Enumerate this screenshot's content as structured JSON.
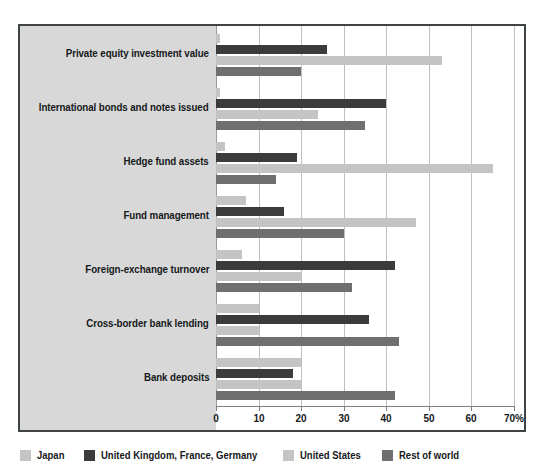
{
  "chart_data": {
    "type": "bar",
    "orientation": "horizontal",
    "title": "",
    "subtitle": "",
    "xlabel": "",
    "ylabel": "",
    "xlim": [
      0,
      70
    ],
    "xticks": [
      0,
      10,
      20,
      30,
      40,
      50,
      60,
      70
    ],
    "xtick_labels": [
      "0",
      "10",
      "20",
      "30",
      "40",
      "50",
      "60",
      "70%"
    ],
    "grid": true,
    "legend_position": "bottom",
    "categories": [
      "Private equity investment value",
      "International bonds and notes issued",
      "Hedge fund assets",
      "Fund management",
      "Foreign-exchange turnover",
      "Cross-border bank lending",
      "Bank deposits"
    ],
    "series": [
      {
        "name": "Japan",
        "color": "#c4c4c4",
        "values": [
          1,
          1,
          2,
          7,
          6,
          10,
          20
        ]
      },
      {
        "name": "United Kingdom, France, Germany",
        "color": "#3b3b3b",
        "values": [
          26,
          40,
          19,
          16,
          42,
          36,
          18
        ]
      },
      {
        "name": "United States",
        "color": "#c4c4c4",
        "values": [
          53,
          24,
          65,
          47,
          20,
          10,
          20
        ]
      },
      {
        "name": "Rest of world",
        "color": "#6f6f6f",
        "values": [
          20,
          35,
          14,
          30,
          32,
          43,
          42
        ]
      }
    ]
  },
  "legend": {
    "items": [
      {
        "label": "Japan",
        "color": "#c4c4c4"
      },
      {
        "label": "United Kingdom, France, Germany",
        "color": "#3b3b3b"
      },
      {
        "label": "United States",
        "color": "#c4c4c4"
      },
      {
        "label": "Rest of world",
        "color": "#6f6f6f"
      }
    ]
  },
  "colors": {
    "frame": "#3f4447",
    "label_panel": "#d8d8d8",
    "gridline": "#bfbfbf",
    "axis": "#7e7e7e",
    "text": "#16181a"
  }
}
